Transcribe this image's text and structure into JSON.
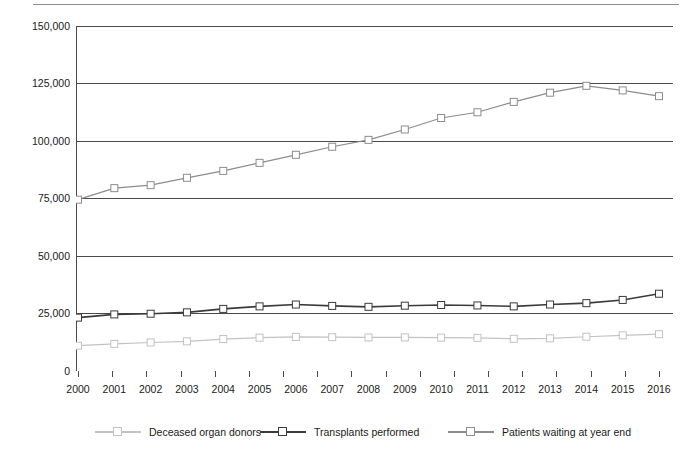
{
  "chart_data": {
    "type": "line",
    "title": "",
    "subtitle": "",
    "xlabel": "",
    "ylabel": "",
    "categories": [
      "2000",
      "2001",
      "2002",
      "2003",
      "2004",
      "2005",
      "2006",
      "2007",
      "2008",
      "2009",
      "2010",
      "2011",
      "2012",
      "2013",
      "2014",
      "2015",
      "2016"
    ],
    "ylim": [
      0,
      150000
    ],
    "yticks": [
      0,
      25000,
      50000,
      75000,
      100000,
      125000,
      150000
    ],
    "ytick_labels": [
      "0",
      "25,000",
      "50,000",
      "75,000",
      "100,000",
      "125,000",
      "150,000"
    ],
    "grid": true,
    "grid_axis": "y",
    "legend_position": "bottom",
    "series": [
      {
        "name": "Deceased organ donors",
        "color": "#c2c2c2",
        "marker": "square",
        "values": [
          11000,
          11800,
          12400,
          12900,
          13900,
          14500,
          14800,
          14700,
          14600,
          14600,
          14500,
          14400,
          14000,
          14200,
          14900,
          15500,
          16000
        ]
      },
      {
        "name": "Transplants performed",
        "color": "#3b3b3b",
        "marker": "square",
        "values": [
          23200,
          24600,
          24900,
          25500,
          27000,
          28100,
          28900,
          28300,
          27900,
          28400,
          28700,
          28500,
          28100,
          28900,
          29500,
          30900,
          33600
        ]
      },
      {
        "name": "Patients waiting at year end",
        "color": "#8c8c8c",
        "marker": "square",
        "values": [
          74500,
          79500,
          80800,
          84000,
          87000,
          90500,
          94000,
          97500,
          100500,
          105000,
          110000,
          112500,
          117000,
          121000,
          124000,
          122000,
          119500
        ]
      }
    ]
  },
  "axis": {
    "y_tick_labels": [
      "150,000",
      "125,000",
      "100,000",
      "75,000",
      "50,000",
      "25,000",
      "0"
    ],
    "x_tick_labels": [
      "2000",
      "2001",
      "2002",
      "2003",
      "2004",
      "2005",
      "2006",
      "2007",
      "2008",
      "2009",
      "2010",
      "2011",
      "2012",
      "2013",
      "2014",
      "2015",
      "2016"
    ]
  },
  "legend": {
    "items": [
      {
        "label": "Deceased organ donors",
        "color": "#c2c2c2"
      },
      {
        "label": "Transplants performed",
        "color": "#3b3b3b"
      },
      {
        "label": "Patients waiting at year end",
        "color": "#8c8c8c"
      }
    ]
  },
  "colors": {
    "axis": "#4a4a4a",
    "grid": "#4a4a4a",
    "donors": "#c2c2c2",
    "transplants": "#3b3b3b",
    "waiting": "#8c8c8c",
    "marker_fill": "#ffffff"
  },
  "top_crop": {
    "left_text": "",
    "right_text": ""
  }
}
